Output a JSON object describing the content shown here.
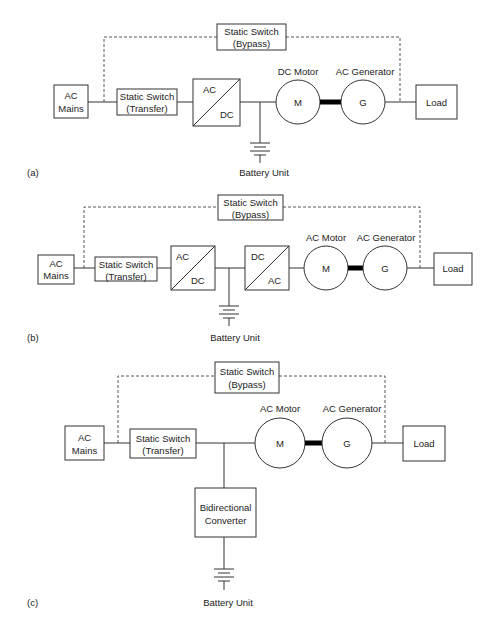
{
  "diagrams": [
    {
      "label": "(a)",
      "bypass": {
        "line1": "Static Switch",
        "line2": "(Bypass)"
      },
      "mains": {
        "line1": "AC",
        "line2": "Mains"
      },
      "transfer": {
        "line1": "Static Switch",
        "line2": "(Transfer)"
      },
      "rectifier": {
        "top": "AC",
        "bottom": "DC"
      },
      "motor": {
        "title": "DC Motor",
        "symbol": "M"
      },
      "generator": {
        "title": "AC Generator",
        "symbol": "G"
      },
      "load": "Load",
      "battery": "Battery Unit"
    },
    {
      "label": "(b)",
      "bypass": {
        "line1": "Static Switch",
        "line2": "(Bypass)"
      },
      "mains": {
        "line1": "AC",
        "line2": "Mains"
      },
      "transfer": {
        "line1": "Static Switch",
        "line2": "(Transfer)"
      },
      "rectifier": {
        "top": "AC",
        "bottom": "DC"
      },
      "inverter": {
        "top": "DC",
        "bottom": "AC"
      },
      "motor": {
        "title": "AC Motor",
        "symbol": "M"
      },
      "generator": {
        "title": "AC Generator",
        "symbol": "G"
      },
      "load": "Load",
      "battery": "Battery Unit"
    },
    {
      "label": "(c)",
      "bypass": {
        "line1": "Static Switch",
        "line2": "(Bypass)"
      },
      "mains": {
        "line1": "AC",
        "line2": "Mains"
      },
      "transfer": {
        "line1": "Static Switch",
        "line2": "(Transfer)"
      },
      "converter": {
        "line1": "Bidirectional",
        "line2": "Converter"
      },
      "motor": {
        "title": "AC Motor",
        "symbol": "M"
      },
      "generator": {
        "title": "AC Generator",
        "symbol": "G"
      },
      "load": "Load",
      "battery": "Battery Unit"
    }
  ]
}
